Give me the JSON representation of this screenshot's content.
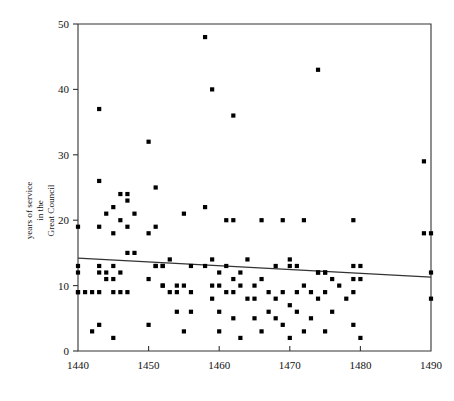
{
  "chart_data": {
    "type": "scatter",
    "title": "",
    "subtitle": "",
    "xlabel": "",
    "ylabel": "years of service in the Great Council",
    "ylabel_lines": [
      "years of service",
      "in the",
      "Great Council"
    ],
    "xlim": [
      1440,
      1490
    ],
    "ylim": [
      0,
      50
    ],
    "xticks": [
      1440,
      1450,
      1460,
      1470,
      1480,
      1490
    ],
    "xticklabels": [
      "1440",
      "1450",
      "1460",
      "1470",
      "1480",
      "1490"
    ],
    "yticks": [
      0,
      10,
      20,
      30,
      40,
      50
    ],
    "yticklabels": [
      "0",
      "10",
      "20",
      "30",
      "40",
      "50"
    ],
    "grid": false,
    "legend": false,
    "marker": "square",
    "marker_color": "#000000",
    "series": [
      {
        "name": "patricians",
        "points": [
          [
            1440,
            19
          ],
          [
            1440,
            13
          ],
          [
            1440,
            12
          ],
          [
            1440,
            9
          ],
          [
            1440,
            9
          ],
          [
            1441,
            9
          ],
          [
            1442,
            9
          ],
          [
            1442,
            3
          ],
          [
            1443,
            37
          ],
          [
            1443,
            26
          ],
          [
            1443,
            19
          ],
          [
            1443,
            13
          ],
          [
            1443,
            12
          ],
          [
            1443,
            9
          ],
          [
            1443,
            4
          ],
          [
            1444,
            12
          ],
          [
            1444,
            21
          ],
          [
            1444,
            11
          ],
          [
            1445,
            22
          ],
          [
            1445,
            18
          ],
          [
            1445,
            13
          ],
          [
            1445,
            11
          ],
          [
            1445,
            9
          ],
          [
            1445,
            2
          ],
          [
            1446,
            20
          ],
          [
            1446,
            24
          ],
          [
            1446,
            12
          ],
          [
            1446,
            9
          ],
          [
            1447,
            23
          ],
          [
            1447,
            24
          ],
          [
            1447,
            19
          ],
          [
            1447,
            15
          ],
          [
            1447,
            9
          ],
          [
            1448,
            21
          ],
          [
            1448,
            15
          ],
          [
            1450,
            32
          ],
          [
            1450,
            18
          ],
          [
            1450,
            11
          ],
          [
            1450,
            4
          ],
          [
            1451,
            25
          ],
          [
            1451,
            19
          ],
          [
            1451,
            13
          ],
          [
            1451,
            13
          ],
          [
            1452,
            13
          ],
          [
            1452,
            13
          ],
          [
            1452,
            10
          ],
          [
            1452,
            10
          ],
          [
            1453,
            9
          ],
          [
            1453,
            14
          ],
          [
            1454,
            10
          ],
          [
            1454,
            9
          ],
          [
            1454,
            6
          ],
          [
            1455,
            21
          ],
          [
            1455,
            10
          ],
          [
            1455,
            3
          ],
          [
            1456,
            13
          ],
          [
            1456,
            9
          ],
          [
            1456,
            6
          ],
          [
            1458,
            48
          ],
          [
            1458,
            22
          ],
          [
            1458,
            13
          ],
          [
            1459,
            40
          ],
          [
            1459,
            14
          ],
          [
            1459,
            10
          ],
          [
            1459,
            8
          ],
          [
            1460,
            12
          ],
          [
            1460,
            10
          ],
          [
            1460,
            6
          ],
          [
            1460,
            3
          ],
          [
            1461,
            20
          ],
          [
            1461,
            13
          ],
          [
            1461,
            9
          ],
          [
            1462,
            36
          ],
          [
            1462,
            20
          ],
          [
            1462,
            11
          ],
          [
            1462,
            9
          ],
          [
            1462,
            5
          ],
          [
            1463,
            12
          ],
          [
            1463,
            10
          ],
          [
            1463,
            2
          ],
          [
            1464,
            14
          ],
          [
            1464,
            8
          ],
          [
            1465,
            10
          ],
          [
            1465,
            8
          ],
          [
            1465,
            5
          ],
          [
            1466,
            20
          ],
          [
            1466,
            11
          ],
          [
            1466,
            3
          ],
          [
            1467,
            9
          ],
          [
            1467,
            6
          ],
          [
            1468,
            13
          ],
          [
            1468,
            8
          ],
          [
            1468,
            5
          ],
          [
            1469,
            20
          ],
          [
            1469,
            9
          ],
          [
            1469,
            4
          ],
          [
            1470,
            14
          ],
          [
            1470,
            13
          ],
          [
            1470,
            7
          ],
          [
            1470,
            2
          ],
          [
            1471,
            13
          ],
          [
            1471,
            9
          ],
          [
            1471,
            6
          ],
          [
            1472,
            20
          ],
          [
            1472,
            10
          ],
          [
            1472,
            3
          ],
          [
            1473,
            9
          ],
          [
            1473,
            5
          ],
          [
            1474,
            43
          ],
          [
            1474,
            12
          ],
          [
            1474,
            12
          ],
          [
            1474,
            8
          ],
          [
            1475,
            12
          ],
          [
            1475,
            12
          ],
          [
            1475,
            9
          ],
          [
            1475,
            3
          ],
          [
            1476,
            11
          ],
          [
            1476,
            6
          ],
          [
            1477,
            10
          ],
          [
            1478,
            8
          ],
          [
            1479,
            20
          ],
          [
            1479,
            13
          ],
          [
            1479,
            11
          ],
          [
            1479,
            9
          ],
          [
            1479,
            4
          ],
          [
            1480,
            13
          ],
          [
            1480,
            11
          ],
          [
            1480,
            2
          ],
          [
            1489,
            29
          ],
          [
            1489,
            18
          ],
          [
            1490,
            18
          ],
          [
            1490,
            12
          ],
          [
            1490,
            8
          ]
        ]
      }
    ],
    "trendline": {
      "x": [
        1440,
        1490
      ],
      "y": [
        14.2,
        11.3
      ],
      "color": "#333333"
    }
  }
}
